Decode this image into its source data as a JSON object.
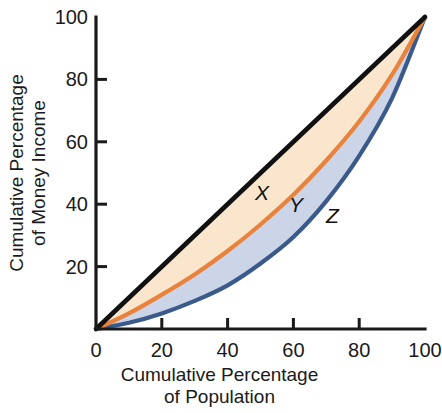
{
  "chart_data": {
    "type": "line",
    "title": "",
    "xlabel": "Cumulative Percentage of Population",
    "ylabel": "Cumulative Percentage of Money Income",
    "xlabel_lines": [
      "Cumulative Percentage",
      "of Population"
    ],
    "ylabel_lines": [
      "Cumulative Percentage",
      "of Money Income"
    ],
    "xlim": [
      0,
      100
    ],
    "ylim": [
      0,
      100
    ],
    "xticks": [
      0,
      20,
      40,
      60,
      80,
      100
    ],
    "yticks": [
      0,
      20,
      40,
      60,
      80,
      100
    ],
    "xtick_labels": [
      "0",
      "20",
      "40",
      "60",
      "80",
      "100"
    ],
    "ytick_labels": [
      "0",
      "20",
      "40",
      "60",
      "80",
      "100"
    ],
    "grid": false,
    "legend": "inline-curve-labels",
    "series": [
      {
        "name": "Line of perfect equality",
        "color": "#111111",
        "x": [
          0,
          10,
          20,
          30,
          40,
          50,
          60,
          70,
          80,
          90,
          100
        ],
        "values": [
          0,
          10,
          20,
          30,
          40,
          50,
          60,
          70,
          80,
          90,
          100
        ]
      },
      {
        "name": "Lorenz curve Y",
        "color": "#E8823C",
        "x": [
          0,
          10,
          20,
          30,
          40,
          50,
          60,
          70,
          80,
          90,
          100
        ],
        "values": [
          0,
          5.0,
          11.0,
          17.5,
          25.0,
          33.5,
          43.0,
          54.0,
          66.5,
          81.5,
          100
        ]
      },
      {
        "name": "Lorenz curve Z",
        "color": "#3A5A8C",
        "x": [
          0,
          10,
          20,
          30,
          40,
          50,
          60,
          70,
          80,
          90,
          100
        ],
        "values": [
          0,
          2.0,
          5.0,
          9.0,
          14.0,
          21.0,
          29.5,
          41.0,
          55.5,
          74.0,
          100
        ]
      }
    ],
    "regions": [
      {
        "name": "X",
        "label": "X",
        "fill": "#FAE6CD",
        "between": [
          "Line of perfect equality",
          "Lorenz curve Y"
        ]
      },
      {
        "name": "Y",
        "label": "Y",
        "fill": "#CCD5E8",
        "between": [
          "Lorenz curve Y",
          "Lorenz curve Z"
        ]
      },
      {
        "name": "Z",
        "label": "Z",
        "fill": "none",
        "between": [
          "Lorenz curve Z",
          "x-axis"
        ]
      }
    ],
    "annotations": [
      {
        "text": "X",
        "x": 50,
        "y": 43
      },
      {
        "text": "Y",
        "x": 61,
        "y": 39
      },
      {
        "text": "Z",
        "x": 72,
        "y": 35
      }
    ],
    "colors": {
      "equality_line": "#111111",
      "curve_y": "#E8823C",
      "curve_z": "#3A5A8C",
      "region_x_fill": "#FAE6CD",
      "region_y_fill": "#CCD5E8",
      "axis": "#1a1a1a",
      "background": "#ffffff"
    }
  }
}
